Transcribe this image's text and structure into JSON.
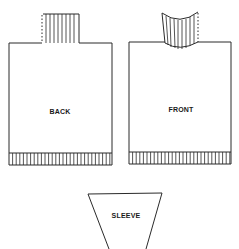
{
  "diagram": {
    "pieces": [
      {
        "id": "back",
        "label": "BACK",
        "neck": "straight ribbed collar, dotted left edge"
      },
      {
        "id": "front",
        "label": "FRONT",
        "neck": "curved ribbed collar, dotted right edge"
      },
      {
        "id": "sleeve",
        "label": "SLEEVE",
        "shape": "inverted trapezoid"
      }
    ],
    "colors": {
      "line": "#2a2a2a",
      "background": "#ffffff"
    }
  }
}
